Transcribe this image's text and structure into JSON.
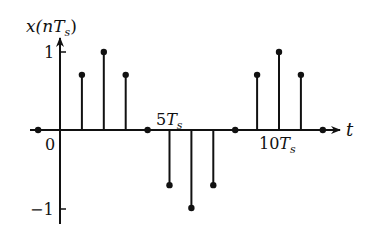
{
  "chart_data": {
    "type": "stem",
    "title": "",
    "ylabel": "x(nT_s)",
    "xlabel": "t",
    "x_unit": "T_s",
    "n": [
      -1,
      0,
      1,
      2,
      3,
      4,
      5,
      6,
      7,
      8,
      9,
      10,
      11,
      12
    ],
    "values": [
      0,
      0,
      0.707,
      1,
      0.707,
      0,
      -0.707,
      -1,
      -0.707,
      0,
      0.707,
      1,
      0.707,
      0
    ],
    "x_tick_labels": [
      {
        "n": 0,
        "label": "0"
      },
      {
        "n": 5,
        "label": "5T_s"
      },
      {
        "n": 10,
        "label": "10T_s"
      }
    ],
    "y_tick_labels": [
      {
        "y": 1,
        "label": "1"
      },
      {
        "y": -1,
        "label": "−1"
      }
    ],
    "ylim": [
      -1,
      1
    ],
    "grid": false,
    "legend": null
  },
  "labels": {
    "y_axis_x": "x(",
    "y_axis_n": "n",
    "y_axis_T": "T",
    "y_axis_s": "s",
    "y_axis_close": ")",
    "x_axis": "t",
    "tick_zero": "0",
    "tick_five": "5",
    "tick_ten": "10",
    "tick_T": "T",
    "tick_s": "s",
    "y_one": "1",
    "y_minus_one": "−1"
  }
}
